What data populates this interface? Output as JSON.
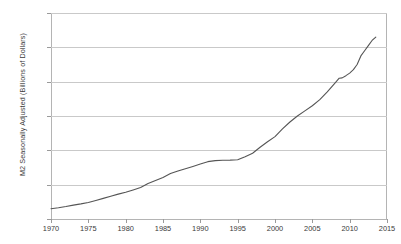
{
  "chart_data": {
    "type": "line",
    "title": "",
    "xlabel": "",
    "ylabel": "M2 Seasonally Adjusted (Billions of Dollars)",
    "xlim": [
      1970,
      2015
    ],
    "ylim": [
      0,
      12000
    ],
    "grid": true,
    "legend": "none",
    "line_color": "#555555",
    "grid_color": "#c9c9c9",
    "axis_color": "#b4b4b4",
    "text_color": "#3a3a3a",
    "y_ticks": [
      0,
      2000,
      4000,
      6000,
      8000,
      10000,
      12000
    ],
    "y_tick_labels": [
      "0",
      "2,000",
      "4,000",
      "6,000",
      "8,000",
      "10,000",
      "12,000"
    ],
    "x_ticks": [
      1970,
      1975,
      1980,
      1985,
      1990,
      1995,
      2000,
      2005,
      2010,
      2015
    ],
    "x_tick_labels": [
      "1970",
      "1975",
      "1980",
      "1985",
      "1990",
      "1995",
      "2000",
      "2005",
      "2010",
      "2015"
    ],
    "series": [
      {
        "name": "M2 Seasonally Adjusted",
        "x": [
          1970,
          1971,
          1972,
          1973,
          1974,
          1975,
          1976,
          1977,
          1978,
          1979,
          1980,
          1981,
          1982,
          1983,
          1984,
          1985,
          1986,
          1987,
          1988,
          1989,
          1990,
          1991,
          1992,
          1993,
          1994,
          1995,
          1996,
          1997,
          1998,
          1999,
          2000,
          2001,
          2002,
          2003,
          2004,
          2005,
          2006,
          2007,
          2008,
          2008.6,
          2009,
          2009.5,
          2010,
          2010.5,
          2011,
          2011.5,
          2012,
          2012.5,
          2013,
          2013.5
        ],
        "values": [
          600,
          660,
          730,
          810,
          880,
          960,
          1080,
          1200,
          1320,
          1450,
          1560,
          1690,
          1830,
          2070,
          2240,
          2420,
          2650,
          2790,
          2930,
          3060,
          3200,
          3340,
          3400,
          3420,
          3430,
          3450,
          3630,
          3830,
          4180,
          4500,
          4800,
          5250,
          5650,
          6000,
          6300,
          6600,
          6950,
          7400,
          7900,
          8200,
          8220,
          8350,
          8500,
          8700,
          9000,
          9500,
          9800,
          10100,
          10400,
          10600
        ]
      }
    ],
    "annotations": []
  }
}
